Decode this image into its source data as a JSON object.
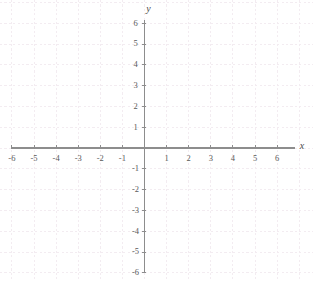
{
  "chart_data": {
    "type": "scatter",
    "title": "",
    "subtitle": "",
    "xlabel": "x",
    "ylabel": "y",
    "xlim": [
      -6,
      6
    ],
    "ylim": [
      -6,
      6
    ],
    "xticks": [
      -6,
      -5,
      -4,
      -3,
      -2,
      -1,
      1,
      2,
      3,
      4,
      5,
      6
    ],
    "yticks": [
      6,
      5,
      4,
      3,
      2,
      1,
      -1,
      -2,
      -3,
      -4,
      -5,
      -6
    ],
    "xtick_labels": [
      "-6",
      "-5",
      "-4",
      "-3",
      "-2",
      "-1",
      "1",
      "2",
      "3",
      "4",
      "5",
      "6"
    ],
    "ytick_labels": [
      "6",
      "5",
      "4",
      "3",
      "2",
      "1",
      "-1",
      "-2",
      "-3",
      "-4",
      "-5",
      "-6"
    ],
    "series": [],
    "values": [],
    "categories": [],
    "grid": true,
    "grid_style": "dashed",
    "legend": false,
    "annotations": [],
    "origin_label": ""
  },
  "axes": {
    "x_axis_name": "x",
    "y_axis_name": "y",
    "x_tick_labels": [
      "-6",
      "-5",
      "-4",
      "-3",
      "-2",
      "-1",
      "1",
      "2",
      "3",
      "4",
      "5",
      "6"
    ],
    "y_tick_labels": [
      "6",
      "5",
      "4",
      "3",
      "2",
      "1",
      "-1",
      "-2",
      "-3",
      "-4",
      "-5",
      "-6"
    ]
  },
  "colors": {
    "background": "#ffffff",
    "axis": "#8a8a8a",
    "grid": "#f4eef2",
    "tick_text": "#5a5a5a",
    "axis_name_text": "#4a4a4a"
  },
  "geometry": {
    "origin_x": 144.5,
    "origin_y": 148,
    "unit_x": 22.1,
    "unit_y": 20.8
  }
}
